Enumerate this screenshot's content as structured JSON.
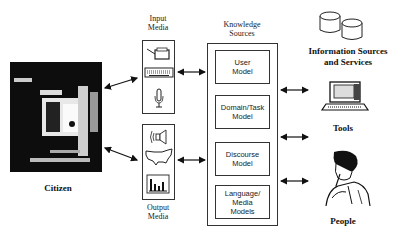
{
  "citizen": {
    "label": "Citizen"
  },
  "input_media": {
    "title_line1": "Input",
    "title_line2": "Media",
    "icons": [
      "printer-icon",
      "keyboard-icon",
      "microphone-icon"
    ]
  },
  "output_media": {
    "title_line1": "Output",
    "title_line2": "Media",
    "icons": [
      "speaker-icon",
      "us-map-icon",
      "bar-chart-icon"
    ]
  },
  "knowledge_sources": {
    "title_line1": "Knowledge",
    "title_line2": "Sources",
    "models": [
      {
        "line1": "User",
        "line2": "Model",
        "line3": ""
      },
      {
        "line1": "Domain/Task",
        "line2": "Model",
        "line3": ""
      },
      {
        "line1": "Discourse",
        "line2": "Model",
        "line3": ""
      },
      {
        "line1": "Language/",
        "line2": "Media",
        "line3": "Models"
      }
    ]
  },
  "right": {
    "info_line1": "Information Sources",
    "info_line2": "and Services",
    "tools": "Tools",
    "people": "People"
  }
}
